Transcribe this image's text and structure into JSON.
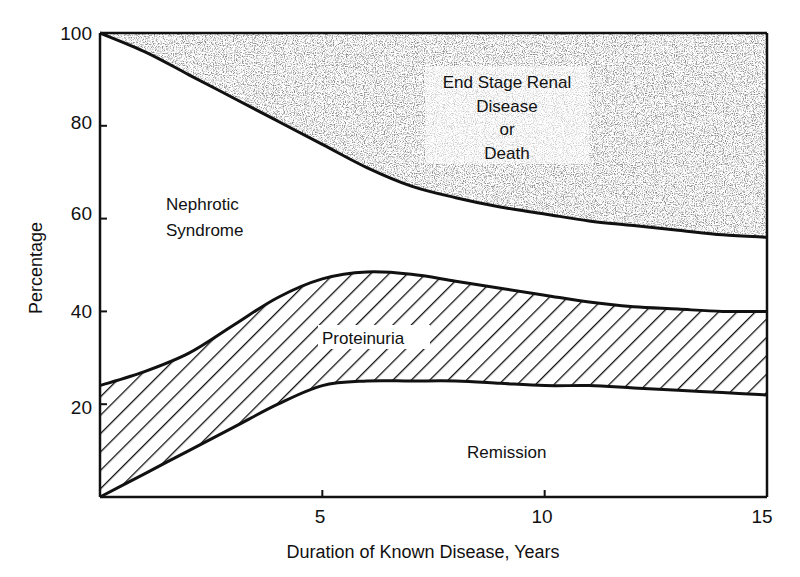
{
  "chart_data": {
    "type": "area",
    "title": "",
    "xlabel": "Duration of Known Disease, Years",
    "ylabel": "Percentage",
    "xlim": [
      0,
      15
    ],
    "ylim": [
      0,
      100
    ],
    "x_ticks": [
      5,
      10,
      15
    ],
    "y_ticks": [
      20,
      40,
      60,
      80,
      100
    ],
    "x_tick_labels": [
      "5",
      "10",
      "15"
    ],
    "y_tick_labels": [
      "20",
      "40",
      "60",
      "80",
      "100"
    ],
    "grid": false,
    "legend": null,
    "x": [
      0,
      1,
      2,
      3,
      4,
      5,
      6,
      7,
      8,
      9,
      10,
      11,
      12,
      13,
      14,
      15
    ],
    "boundaries": [
      {
        "name": "Remission / Proteinuria boundary (lower proteinuria curve)",
        "values": [
          0,
          5,
          10,
          15,
          20,
          24,
          25,
          25,
          25,
          24.5,
          24,
          24,
          23.5,
          23,
          22.5,
          22
        ]
      },
      {
        "name": "Proteinuria / Nephrotic Syndrome boundary (upper proteinuria curve)",
        "values": [
          24,
          27,
          31,
          37,
          43,
          47,
          48.5,
          48,
          46.5,
          45,
          43.5,
          42,
          41,
          40.5,
          40,
          40
        ]
      },
      {
        "name": "Nephrotic Syndrome / End Stage Renal Disease or Death boundary",
        "values": [
          100,
          96,
          91,
          86,
          81,
          76,
          71,
          67,
          64.5,
          62.5,
          61,
          59.5,
          58.5,
          57.5,
          56.5,
          56
        ]
      }
    ],
    "regions": [
      {
        "name": "Remission",
        "fill": "white",
        "between": [
          "axis",
          "lower proteinuria curve"
        ]
      },
      {
        "name": "Proteinuria",
        "fill": "diagonal-hatch",
        "between": [
          "lower proteinuria curve",
          "upper proteinuria curve"
        ]
      },
      {
        "name": "Nephrotic Syndrome",
        "fill": "white",
        "between": [
          "upper proteinuria curve",
          "ESRD curve"
        ]
      },
      {
        "name": "End Stage Renal Disease or Death",
        "fill": "stipple",
        "between": [
          "ESRD curve",
          "100"
        ]
      }
    ]
  },
  "labels": {
    "xlabel": "Duration of Known Disease, Years",
    "ylabel": "Percentage",
    "x_ticks": [
      "5",
      "10",
      "15"
    ],
    "y_ticks": [
      "20",
      "40",
      "60",
      "80",
      "100"
    ],
    "region_esrd": [
      "End Stage Renal",
      "Disease",
      "or",
      "Death"
    ],
    "region_nephrotic": [
      "Nephrotic",
      "Syndrome"
    ],
    "region_proteinuria": "Proteinuria",
    "region_remission": "Remission"
  },
  "colors": {
    "ink": "#111111",
    "background": "#ffffff",
    "stipple": "#8a8a8a"
  }
}
